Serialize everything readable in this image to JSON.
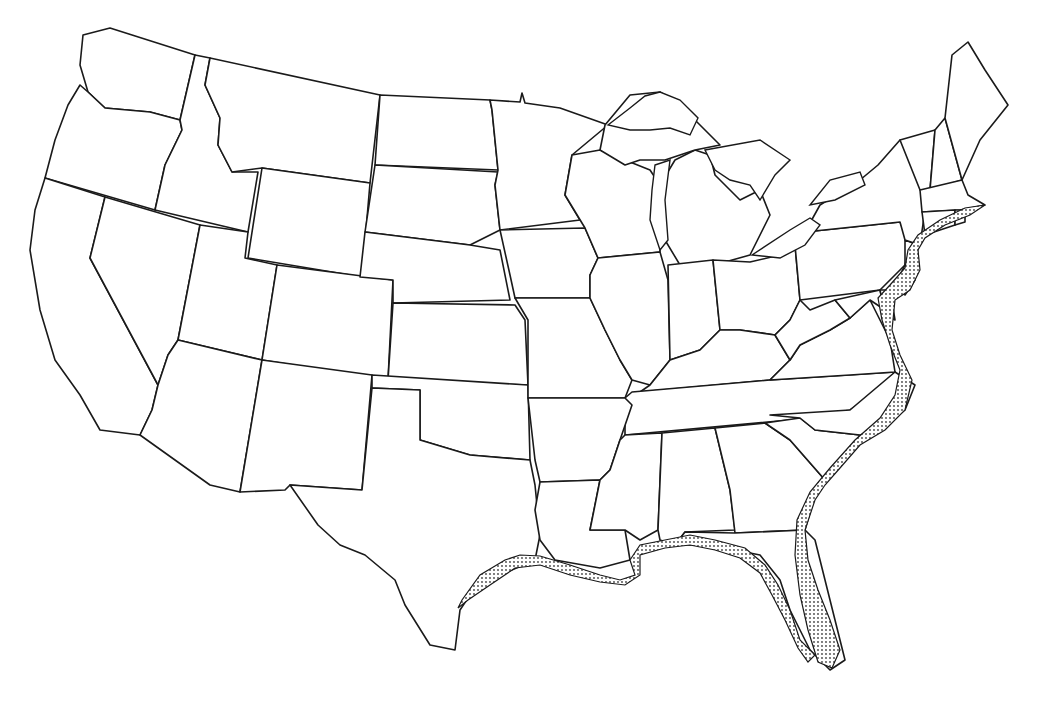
{
  "map": {
    "title": "",
    "type": "outline-map",
    "region": "Contiguous United States",
    "boundaries": "state outlines",
    "highlight": {
      "description": "stippled coastal band along the Atlantic and Gulf coasts",
      "pattern": "dotted",
      "extent": [
        "Massachusetts",
        "Rhode Island",
        "Connecticut",
        "New York",
        "New Jersey",
        "Delaware",
        "Maryland",
        "Virginia",
        "North Carolina",
        "South Carolina",
        "Georgia",
        "Florida",
        "Alabama",
        "Mississippi",
        "Louisiana",
        "Texas"
      ]
    },
    "colors": {
      "background": "#ffffff",
      "outline": "#1a1a1a",
      "stipple": "#444444"
    },
    "labels": []
  }
}
